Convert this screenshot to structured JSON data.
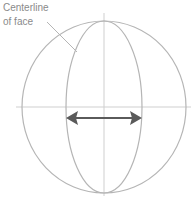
{
  "annotation": {
    "line1": "Centerline",
    "line2": "of face"
  },
  "colors": {
    "guide": "#cfcfcf",
    "outline": "#b5b5b5",
    "arrow": "#5a5a5a",
    "label": "#8a8a8a"
  },
  "geometry": {
    "circle": {
      "cx": 104,
      "cy": 107,
      "rx": 82,
      "ry": 86
    },
    "face_ellipse": {
      "cx": 104,
      "cy": 107,
      "rx": 38,
      "ry": 86
    },
    "horizontal_guide": {
      "x1": 16,
      "x2": 191,
      "y": 107
    },
    "vertical_guide": {
      "x": 104,
      "y1": 13,
      "y2": 196
    },
    "leader": {
      "x1": 47,
      "y1": 22,
      "x2": 77,
      "y2": 52
    },
    "arrow": {
      "x1": 66,
      "x2": 142,
      "y": 118
    }
  }
}
